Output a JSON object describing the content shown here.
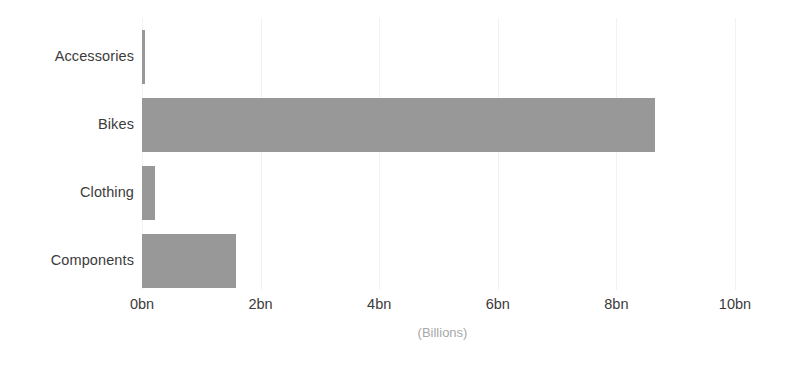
{
  "chart_data": {
    "type": "bar",
    "orientation": "horizontal",
    "title": "",
    "subtitle": "",
    "xlabel": "(Billions)",
    "ylabel": "",
    "categories": [
      "Accessories",
      "Bikes",
      "Clothing",
      "Components"
    ],
    "values": [
      0.05,
      8.65,
      0.22,
      1.58
    ],
    "series": [
      {
        "name": "Sales",
        "values": [
          0.05,
          8.65,
          0.22,
          1.58
        ]
      }
    ],
    "xlim": [
      0,
      10.95
    ],
    "xticks": [
      0,
      2,
      4,
      6,
      8,
      10
    ],
    "xticklabels": [
      "0bn",
      "2bn",
      "4bn",
      "6bn",
      "8bn",
      "10bn"
    ],
    "grid": false,
    "legend": false,
    "legend_position": "none",
    "bar_color": "#989898",
    "axis_label_color": "#a8a8a8",
    "tick_label_color": "#3b3b3b",
    "background_color": "#ffffff"
  },
  "axis": {
    "x_title": "(Billions)",
    "ticks": [
      {
        "label": "0bn",
        "value": 0
      },
      {
        "label": "2bn",
        "value": 2
      },
      {
        "label": "4bn",
        "value": 4
      },
      {
        "label": "6bn",
        "value": 6
      },
      {
        "label": "8bn",
        "value": 8
      },
      {
        "label": "10bn",
        "value": 10
      }
    ]
  },
  "bars": [
    {
      "category": "Accessories",
      "value": 0.05
    },
    {
      "category": "Bikes",
      "value": 8.65
    },
    {
      "category": "Clothing",
      "value": 0.22
    },
    {
      "category": "Components",
      "value": 1.58
    }
  ]
}
